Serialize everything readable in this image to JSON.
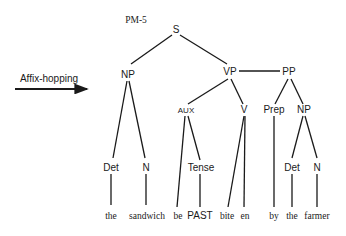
{
  "diagram": {
    "title": "PM-5",
    "transformation_label": "Affix-hopping",
    "nodes": {
      "S": "S",
      "NP1": "NP",
      "VP": "VP",
      "PP": "PP",
      "AUX": "AUX",
      "V": "V",
      "Prep": "Prep",
      "NP2": "NP",
      "Det1": "Det",
      "N1": "N",
      "Tense": "Tense",
      "Det2": "Det",
      "N2": "N"
    },
    "leaves": {
      "w1": "the",
      "w2": "sandwich",
      "w3": "be",
      "w4": "PAST",
      "w5": "bite",
      "w6": "en",
      "w7": "by",
      "w8": "the",
      "w9": "farmer"
    },
    "edges": [
      [
        "S",
        "NP1"
      ],
      [
        "S",
        "VP"
      ],
      [
        "VP",
        "PP"
      ],
      [
        "NP1",
        "Det1"
      ],
      [
        "NP1",
        "N1"
      ],
      [
        "VP",
        "AUX"
      ],
      [
        "VP",
        "V"
      ],
      [
        "PP",
        "Prep"
      ],
      [
        "PP",
        "NP2"
      ],
      [
        "AUX",
        "w3"
      ],
      [
        "AUX",
        "Tense"
      ],
      [
        "V",
        "w5"
      ],
      [
        "V",
        "w6"
      ],
      [
        "Det1",
        "w1"
      ],
      [
        "N1",
        "w2"
      ],
      [
        "Tense",
        "w4"
      ],
      [
        "Prep",
        "w7"
      ],
      [
        "NP2",
        "Det2"
      ],
      [
        "NP2",
        "N2"
      ],
      [
        "Det2",
        "w8"
      ],
      [
        "N2",
        "w9"
      ]
    ]
  }
}
